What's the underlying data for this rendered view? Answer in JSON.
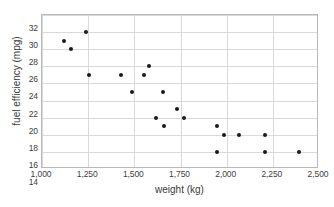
{
  "chart_data": {
    "type": "scatter",
    "title": "",
    "xlabel": "weight (kg)",
    "ylabel": "fuel efficiency (mpg)",
    "xlim": [
      1000,
      2500
    ],
    "ylim": [
      14,
      32
    ],
    "xticks": [
      1000,
      1250,
      1500,
      1750,
      2000,
      2250,
      2500
    ],
    "xtick_labels": [
      "1,000",
      "1,250",
      "1,500",
      "1,750",
      "2,000",
      "2,250",
      "2,500"
    ],
    "yticks": [
      14,
      16,
      18,
      20,
      22,
      24,
      26,
      28,
      30,
      32
    ],
    "ytick_labels": [
      "14",
      "16",
      "18",
      "20",
      "22",
      "24",
      "26",
      "28",
      "30",
      "32"
    ],
    "grid": true,
    "legend": false,
    "marker_color": "#1a1a1a",
    "gridline_color": "#d9d9d9",
    "border_color": "#b9b9b9",
    "background_color": "#ffffff",
    "points": [
      {
        "x": 1120,
        "y": 29
      },
      {
        "x": 1155,
        "y": 28
      },
      {
        "x": 1240,
        "y": 30
      },
      {
        "x": 1255,
        "y": 25
      },
      {
        "x": 1430,
        "y": 25
      },
      {
        "x": 1490,
        "y": 23
      },
      {
        "x": 1550,
        "y": 25
      },
      {
        "x": 1580,
        "y": 26
      },
      {
        "x": 1615,
        "y": 20
      },
      {
        "x": 1655,
        "y": 23
      },
      {
        "x": 1660,
        "y": 19
      },
      {
        "x": 1730,
        "y": 21
      },
      {
        "x": 1770,
        "y": 20
      },
      {
        "x": 1950,
        "y": 19
      },
      {
        "x": 1950,
        "y": 16
      },
      {
        "x": 1985,
        "y": 18
      },
      {
        "x": 2065,
        "y": 18
      },
      {
        "x": 2210,
        "y": 18
      },
      {
        "x": 2210,
        "y": 16
      },
      {
        "x": 2390,
        "y": 16
      }
    ]
  }
}
